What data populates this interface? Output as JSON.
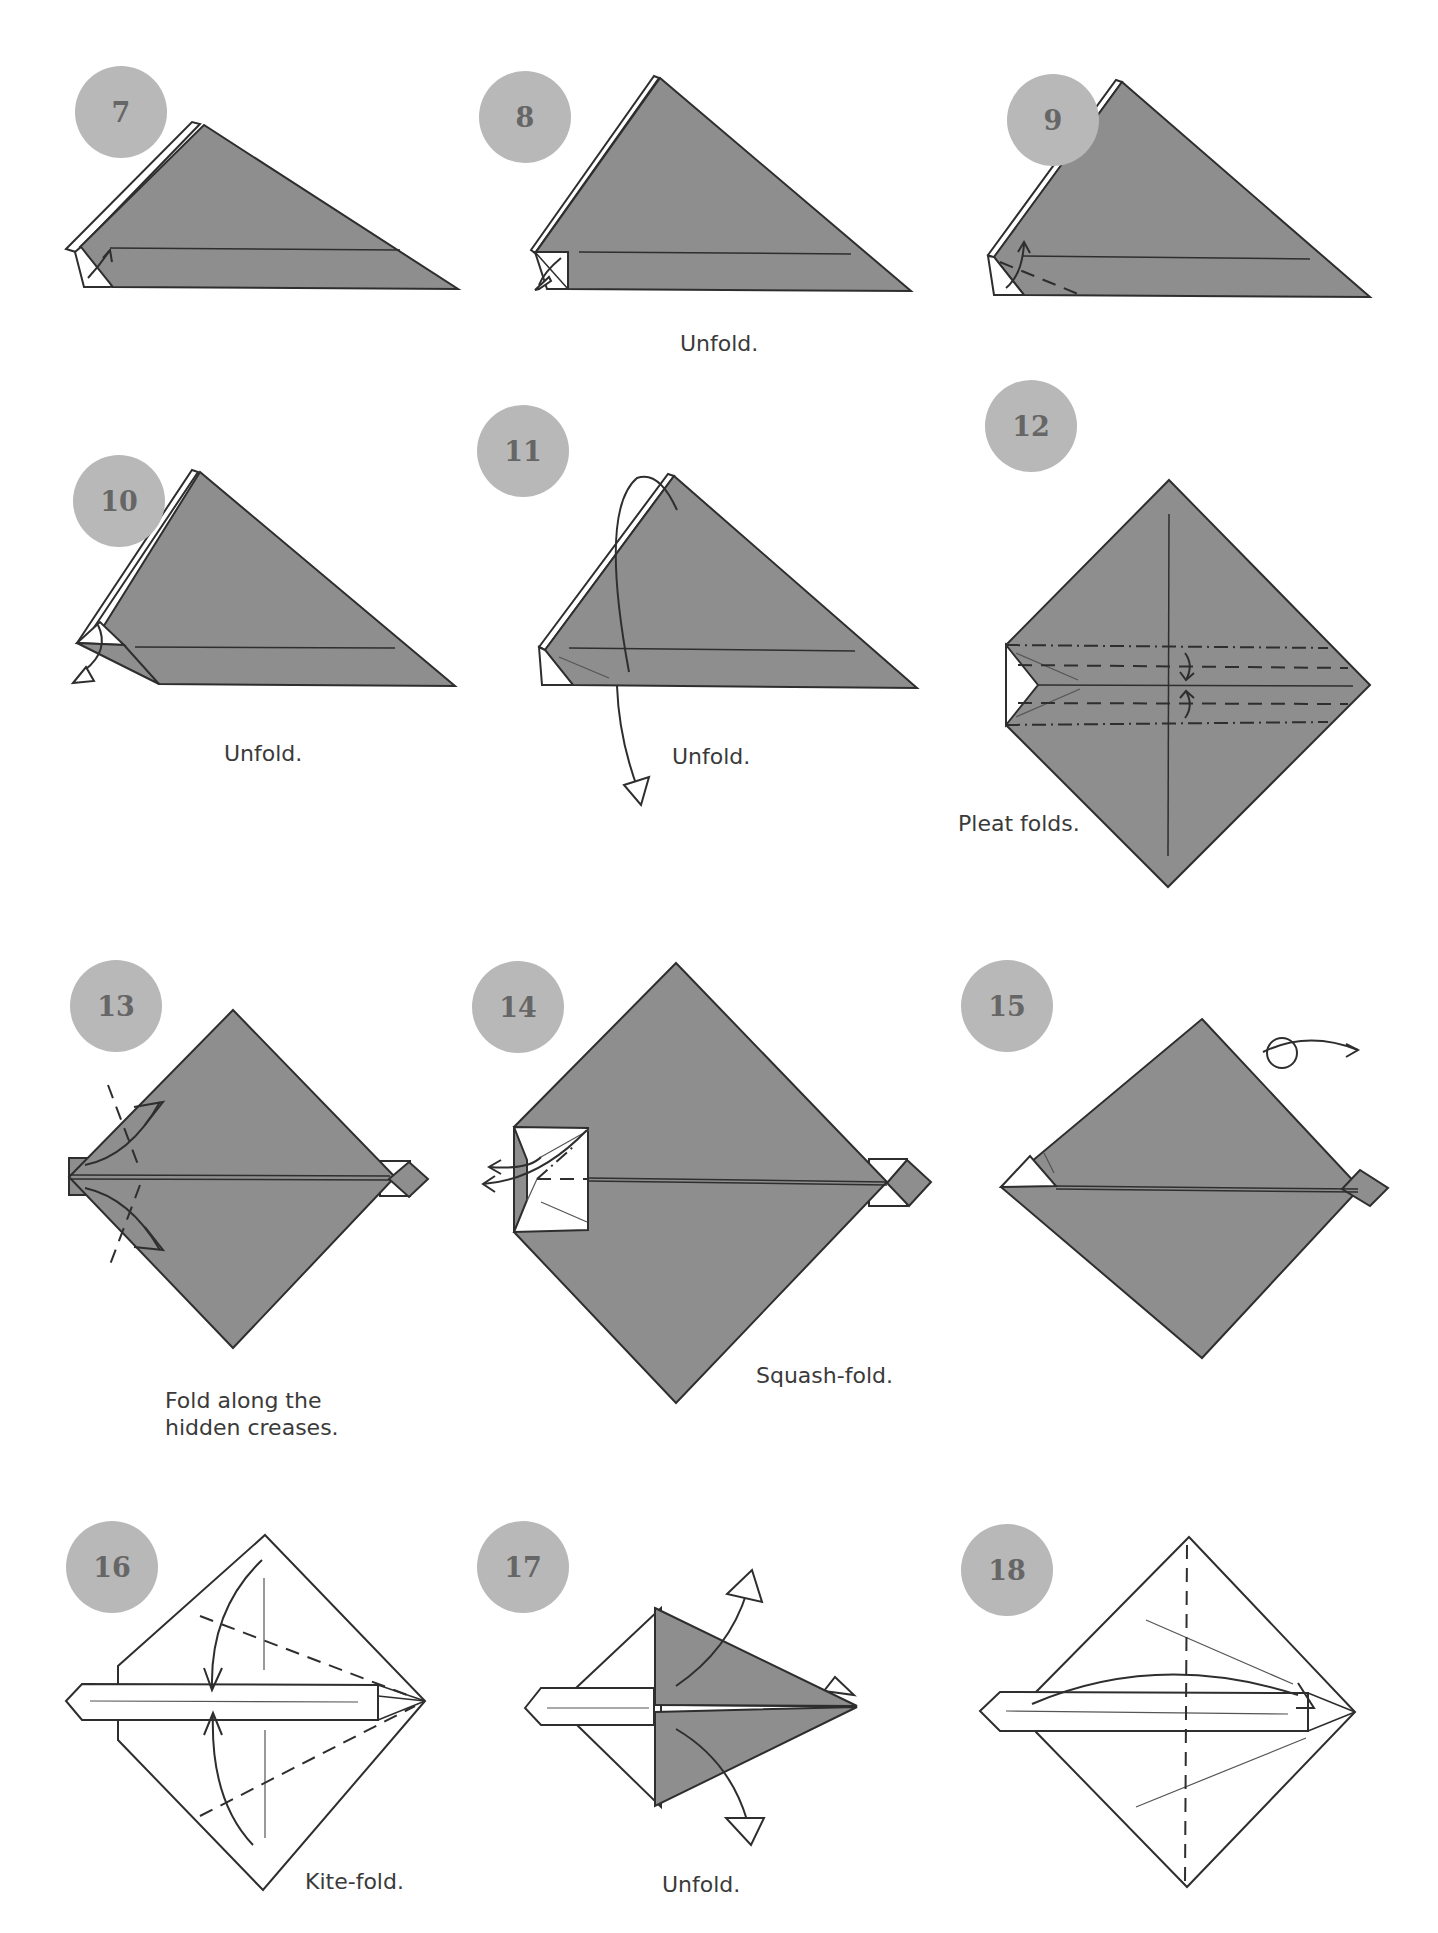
{
  "page": {
    "background": "#ffffff",
    "paper_color": "#8e8e8e",
    "badge_color": "#b8b8b8",
    "badge_text_color": "#666666",
    "line_color": "#2e2e2e"
  },
  "steps": [
    {
      "number": "7",
      "caption": "",
      "diagram": "triangle-with-corner-fold",
      "icons": [
        "valley-fold-arrow-icon"
      ]
    },
    {
      "number": "8",
      "caption": "Unfold.",
      "diagram": "triangle-corner-folded",
      "icons": [
        "unfold-arrow-icon"
      ]
    },
    {
      "number": "9",
      "caption": "",
      "diagram": "triangle-corner-dashed",
      "icons": [
        "valley-fold-arrow-icon",
        "valley-fold-line"
      ]
    },
    {
      "number": "10",
      "caption": "Unfold.",
      "diagram": "triangle-corner-folded-back",
      "icons": [
        "unfold-arrow-icon"
      ]
    },
    {
      "number": "11",
      "caption": "Unfold.",
      "diagram": "triangle-open-out",
      "icons": [
        "unfold-arrow-icon"
      ]
    },
    {
      "number": "12",
      "caption": "Pleat folds.",
      "diagram": "square-pleat",
      "icons": [
        "mountain-fold-line",
        "valley-fold-line",
        "pleat-arrow-icon"
      ]
    },
    {
      "number": "13",
      "caption": "Fold along the\nhidden creases.",
      "diagram": "square-with-strip",
      "icons": [
        "fold-arrow-icon",
        "valley-fold-line"
      ]
    },
    {
      "number": "14",
      "caption": "Squash-fold.",
      "diagram": "square-squash",
      "icons": [
        "squash-arrow-icon"
      ]
    },
    {
      "number": "15",
      "caption": "",
      "diagram": "square-turn-over",
      "icons": [
        "turn-over-icon"
      ]
    },
    {
      "number": "16",
      "caption": "Kite-fold.",
      "diagram": "white-square-kite",
      "icons": [
        "fold-arrow-icon",
        "valley-fold-line"
      ]
    },
    {
      "number": "17",
      "caption": "Unfold.",
      "diagram": "kite-folded",
      "icons": [
        "unfold-arrow-icon"
      ]
    },
    {
      "number": "18",
      "caption": "",
      "diagram": "white-square-crease",
      "icons": [
        "fold-arrow-icon",
        "valley-fold-line"
      ]
    }
  ]
}
